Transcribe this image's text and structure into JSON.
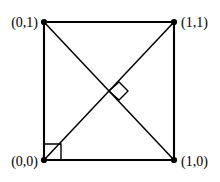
{
  "figure": {
    "background_color": "#ffffff",
    "stroke_color": "#000000",
    "width": 220,
    "height": 182
  },
  "geometry": {
    "square": {
      "left": 44,
      "top": 22,
      "right": 174,
      "bottom": 160,
      "edge_path": "M 44 22 L 174 22 L 174 160 L 44 160 Z"
    },
    "diagonals": [
      {
        "name": "diagonal-tl-br",
        "path": "M 44 22 L 174 160"
      },
      {
        "name": "diagonal-bl-tr",
        "path": "M 44 160 L 174 22"
      }
    ],
    "center": {
      "x": 109,
      "y": 91
    },
    "markers": [
      {
        "name": "right-angle-marker-center",
        "path": "M 109 91 L 119 82 L 128 91 L 119 100 Z"
      },
      {
        "name": "right-angle-marker-origin",
        "path": "M 44 144 L 61 144 L 61 160"
      }
    ]
  },
  "vertices": [
    {
      "name": "vertex-top-left",
      "label": "(0,1)",
      "x": 44,
      "y": 22,
      "dot_radius": 3.1,
      "label_x": 38,
      "label_y": 27,
      "label_anchor": "end"
    },
    {
      "name": "vertex-top-right",
      "label": "(1,1)",
      "x": 174,
      "y": 22,
      "dot_radius": 3.1,
      "label_x": 181,
      "label_y": 27,
      "label_anchor": "start"
    },
    {
      "name": "vertex-bottom-left",
      "label": "(0,0)",
      "x": 44,
      "y": 160,
      "dot_radius": 3.1,
      "label_x": 38,
      "label_y": 166,
      "label_anchor": "end"
    },
    {
      "name": "vertex-bottom-right",
      "label": "(1,0)",
      "x": 174,
      "y": 160,
      "dot_radius": 3.1,
      "label_x": 181,
      "label_y": 166,
      "label_anchor": "start"
    }
  ]
}
